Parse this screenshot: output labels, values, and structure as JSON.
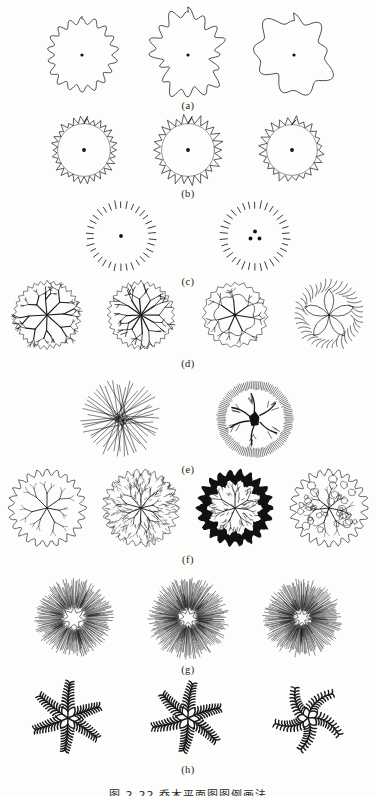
{
  "document": {
    "type": "scanned-textbook-figure",
    "page_background": "#fdfdfc",
    "ink_color": "#1a1a1a",
    "caption": "图 2-22  乔木平面图图例画法",
    "caption_visible_fraction": "clipped at bottom edge"
  },
  "figure": {
    "title_label": "tree plan symbols",
    "rows": [
      {
        "label": "(a)",
        "name": "scalloped-outline-crowns",
        "count": 3,
        "style": "outline",
        "items": [
          {
            "name": "scallop-18-lobe",
            "lobes": 18,
            "radius": 33,
            "amplitude": 3.4,
            "center_dot": true,
            "jitter": 0.04
          },
          {
            "name": "scallop-16-lobe-irregular",
            "lobes": 16,
            "radius": 35,
            "amplitude": 4.6,
            "center_dot": true,
            "jitter": 0.16
          },
          {
            "name": "scallop-9-lobe-broad",
            "lobes": 9,
            "radius": 36,
            "amplitude": 4.2,
            "center_dot": true,
            "jitter": 0.12
          }
        ]
      },
      {
        "label": "(b)",
        "name": "spiky-ring-crowns",
        "count": 3,
        "style": "spiky-ring",
        "items": [
          {
            "name": "spiky-ring-fine",
            "spikes": 30,
            "radius": 27,
            "spike_len": 6.5,
            "center_dot": true
          },
          {
            "name": "spiky-ring-medium",
            "spikes": 26,
            "radius": 27,
            "spike_len": 8.5,
            "center_dot": true
          },
          {
            "name": "spiky-ring-coarse",
            "spikes": 24,
            "radius": 26,
            "spike_len": 7.5,
            "center_dot": true
          }
        ]
      },
      {
        "label": "(c)",
        "name": "dashed-tick-ring-crowns",
        "count": 2,
        "style": "tick-ring",
        "items": [
          {
            "name": "tick-ring-single-trunk",
            "ticks": 34,
            "radius": 28,
            "tick_len": 7,
            "center_dot": true,
            "trunk_dots": 1
          },
          {
            "name": "tick-ring-triple-trunk",
            "ticks": 34,
            "radius": 28,
            "tick_len": 7,
            "center_dot": false,
            "trunk_dots": 3
          }
        ]
      },
      {
        "label": "(d)",
        "name": "branching-structure-crowns",
        "count": 4,
        "style": "branching",
        "items": [
          {
            "name": "dendritic-fine-branch",
            "mains": 8,
            "depth": 3,
            "radius": 34,
            "rim": "zigzag"
          },
          {
            "name": "dendritic-heavy-center",
            "mains": 12,
            "depth": 2,
            "radius": 34,
            "rim": "zigzag",
            "thick_center": true
          },
          {
            "name": "loop-branch-open",
            "mains": 7,
            "depth": 2,
            "radius": 33,
            "rim": "feather",
            "loops": true
          },
          {
            "name": "petal-lobe-curl",
            "mains": 5,
            "depth": 1,
            "radius": 34,
            "rim": "curl",
            "petals": 5
          }
        ]
      },
      {
        "label": "(e)",
        "name": "radial-line-crowns",
        "count": 2,
        "style": "radial-lines",
        "items": [
          {
            "name": "straight-radial-burst",
            "rays": 52,
            "radius": 38,
            "irregular": true
          },
          {
            "name": "branch-with-dense-rim",
            "rays": 120,
            "radius": 38,
            "rim_band": 8,
            "solid_trunk": true
          }
        ]
      },
      {
        "label": "(f)",
        "name": "foliage-texture-crowns",
        "count": 4,
        "style": "foliage",
        "items": [
          {
            "name": "cloud-outline-light-fill",
            "radius": 36,
            "fill": "none",
            "edge": "cloud"
          },
          {
            "name": "dense-stipple-texture",
            "radius": 36,
            "fill": "hatch",
            "edge": "spiky"
          },
          {
            "name": "solid-black-shadow-edge",
            "radius": 36,
            "fill": "solid-ring",
            "edge": "cloud"
          },
          {
            "name": "scattered-clump-texture",
            "radius": 36,
            "fill": "clumps",
            "edge": "cloud"
          }
        ]
      },
      {
        "label": "(g)",
        "name": "dense-radial-fan-crowns",
        "count": 3,
        "style": "dense-radial",
        "items": [
          {
            "name": "radial-fan-open-core",
            "rays": 150,
            "radius": 39,
            "core": 11
          },
          {
            "name": "radial-fan-star-core",
            "rays": 165,
            "radius": 40,
            "core": 9
          },
          {
            "name": "radial-fan-small-core",
            "rays": 155,
            "radius": 39,
            "core": 8
          }
        ]
      },
      {
        "label": "(h)",
        "name": "palm-frond-crowns",
        "count": 3,
        "style": "palm",
        "items": [
          {
            "name": "palm-6-frond-straight",
            "fronds": 6,
            "radius": 36,
            "curve": 0.12
          },
          {
            "name": "palm-6-frond-angled",
            "fronds": 6,
            "radius": 36,
            "curve": 0.2
          },
          {
            "name": "palm-5-frond-curved",
            "fronds": 5,
            "radius": 36,
            "curve": 0.85
          }
        ]
      }
    ]
  }
}
